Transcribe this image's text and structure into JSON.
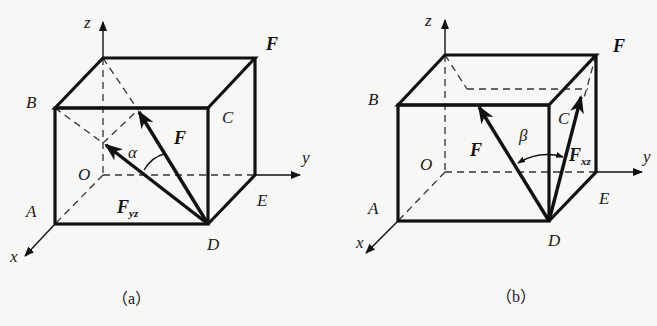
{
  "figures": [
    {
      "id": "a",
      "caption": "（a）",
      "axes": {
        "x": "x",
        "y": "y",
        "z": "z"
      },
      "points": {
        "O": "O",
        "A": "A",
        "B": "B",
        "C": "C",
        "D": "D",
        "E": "E",
        "F": "F"
      },
      "vectors": {
        "force": "F",
        "projection": "F",
        "projection_sub": "yz"
      },
      "angle": "α"
    },
    {
      "id": "b",
      "caption": "（b）",
      "axes": {
        "x": "x",
        "y": "y",
        "z": "z"
      },
      "points": {
        "O": "O",
        "A": "A",
        "B": "B",
        "C": "C",
        "D": "D",
        "E": "E",
        "F": "F"
      },
      "vectors": {
        "force": "F",
        "projection": "F",
        "projection_sub": "xz"
      },
      "angle": "β"
    }
  ],
  "colors": {
    "line": "#111111",
    "background": "#f7f7f5"
  }
}
